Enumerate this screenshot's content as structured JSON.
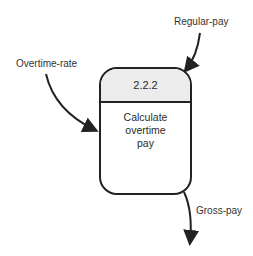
{
  "diagram": {
    "type": "data-flow-process",
    "process": {
      "id": "2.2.2",
      "name_lines": [
        "Calculate",
        "overtime",
        "pay"
      ]
    },
    "flows": {
      "in_regular": "Regular-pay",
      "in_overtime": "Overtime-rate",
      "out_gross": "Gross-pay"
    },
    "colors": {
      "stroke": "#222222",
      "header_fill": "#ececec"
    }
  }
}
